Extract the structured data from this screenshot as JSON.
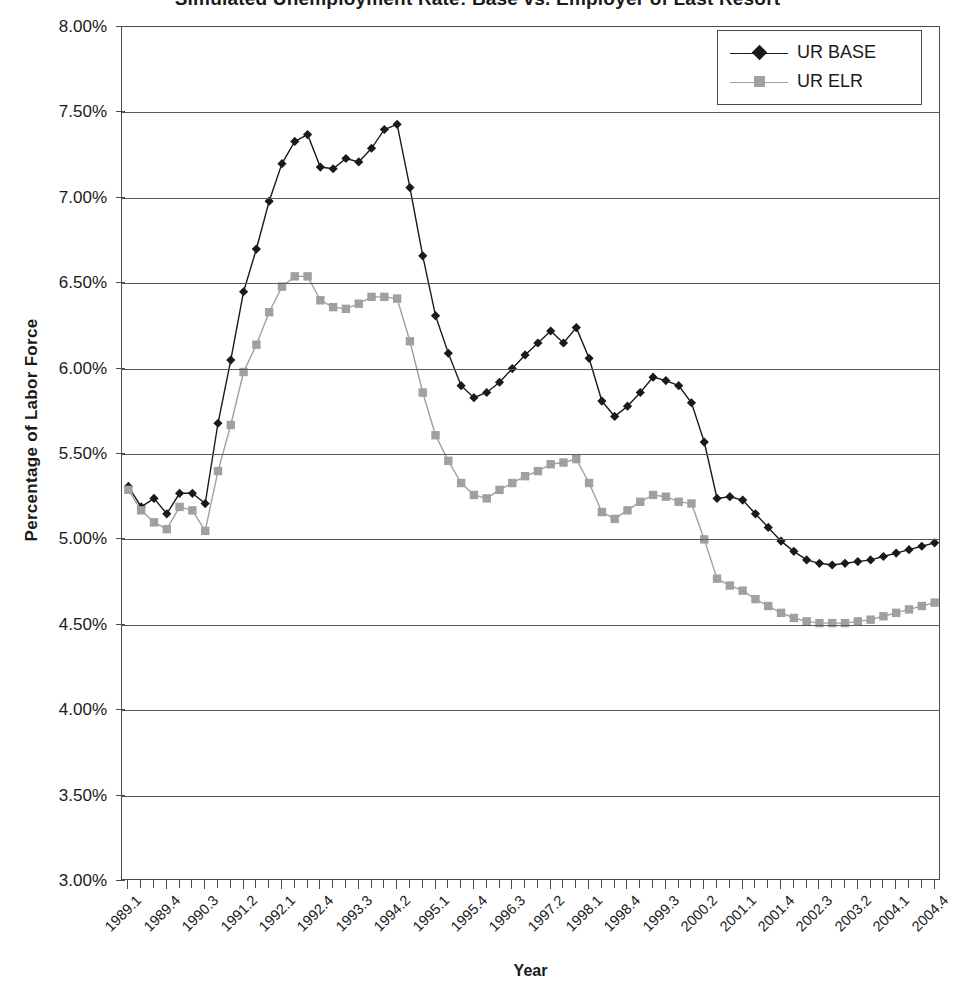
{
  "chart": {
    "title": "Simulated Unemployment Rate: Base vs. Employer of Last Resort",
    "xlabel": "Year",
    "ylabel": "Percentage of Labor Force"
  },
  "legend": {
    "position": "top-right",
    "items": [
      {
        "label": "UR BASE",
        "color": "#1a1a1a",
        "marker": "diamond"
      },
      {
        "label": "UR ELR",
        "color": "#a0a0a0",
        "marker": "square"
      }
    ]
  },
  "axes": {
    "y_ticks": [
      "3.00%",
      "3.50%",
      "4.00%",
      "4.50%",
      "5.00%",
      "5.50%",
      "6.00%",
      "6.50%",
      "7.00%",
      "7.50%",
      "8.00%"
    ],
    "y_values": [
      3.0,
      3.5,
      4.0,
      4.5,
      5.0,
      5.5,
      6.0,
      6.5,
      7.0,
      7.5,
      8.0
    ],
    "y_min": 3.0,
    "y_max": 8.0,
    "x_tick_labels": [
      "1989.1",
      "1989.4",
      "1990.3",
      "1991.2",
      "1992.1",
      "1992.4",
      "1993.3",
      "1994.2",
      "1995.1",
      "1995.4",
      "1996.3",
      "1997.2",
      "1998.1",
      "1998.4",
      "1999.3",
      "2000.2",
      "2001.1",
      "2001.4",
      "2002.3",
      "2003.2",
      "2004.1",
      "2004.4"
    ],
    "x_tick_label_every": 3,
    "grid": "horizontal"
  },
  "chart_data": {
    "type": "line",
    "title": "Simulated Unemployment Rate: Base vs. Employer of Last Resort",
    "xlabel": "Year",
    "ylabel": "Percentage of Labor Force",
    "ylim": [
      3.0,
      8.0
    ],
    "grid": true,
    "legend_position": "top-right",
    "x": [
      "1989.1",
      "1989.2",
      "1989.3",
      "1989.4",
      "1990.1",
      "1990.2",
      "1990.3",
      "1990.4",
      "1991.1",
      "1991.2",
      "1991.3",
      "1991.4",
      "1992.1",
      "1992.2",
      "1992.3",
      "1992.4",
      "1993.1",
      "1993.2",
      "1993.3",
      "1993.4",
      "1994.1",
      "1994.2",
      "1994.3",
      "1994.4",
      "1995.1",
      "1995.2",
      "1995.3",
      "1995.4",
      "1996.1",
      "1996.2",
      "1996.3",
      "1996.4",
      "1997.1",
      "1997.2",
      "1997.3",
      "1997.4",
      "1998.1",
      "1998.2",
      "1998.3",
      "1998.4",
      "1999.1",
      "1999.2",
      "1999.3",
      "1999.4",
      "2000.1",
      "2000.2",
      "2000.3",
      "2000.4",
      "2001.1",
      "2001.2",
      "2001.3",
      "2001.4",
      "2002.1",
      "2002.2",
      "2002.3",
      "2002.4",
      "2003.1",
      "2003.2",
      "2003.3",
      "2003.4",
      "2004.1",
      "2004.2",
      "2004.3",
      "2004.4"
    ],
    "series": [
      {
        "name": "UR BASE",
        "color": "#1a1a1a",
        "marker": "diamond",
        "values": [
          5.31,
          5.19,
          5.24,
          5.15,
          5.27,
          5.27,
          5.21,
          5.68,
          6.05,
          6.45,
          6.7,
          6.98,
          7.2,
          7.33,
          7.37,
          7.18,
          7.17,
          7.23,
          7.21,
          7.29,
          7.4,
          7.43,
          7.06,
          6.66,
          6.31,
          6.09,
          5.9,
          5.83,
          5.86,
          5.92,
          6.0,
          6.08,
          6.15,
          6.22,
          6.15,
          6.24,
          6.06,
          5.81,
          5.72,
          5.78,
          5.86,
          5.95,
          5.93,
          5.9,
          5.8,
          5.57,
          5.24,
          5.25,
          5.23,
          5.15,
          5.07,
          4.99,
          4.93,
          4.88,
          4.86,
          4.85,
          4.86,
          4.87,
          4.88,
          4.9,
          4.92,
          4.94,
          4.96,
          4.98
        ]
      },
      {
        "name": "UR ELR",
        "color": "#a0a0a0",
        "marker": "square",
        "values": [
          5.29,
          5.17,
          5.1,
          5.06,
          5.19,
          5.17,
          5.05,
          5.4,
          5.67,
          5.98,
          6.14,
          6.33,
          6.48,
          6.54,
          6.54,
          6.4,
          6.36,
          6.35,
          6.38,
          6.42,
          6.42,
          6.41,
          6.16,
          5.86,
          5.61,
          5.46,
          5.33,
          5.26,
          5.24,
          5.29,
          5.33,
          5.37,
          5.4,
          5.44,
          5.45,
          5.47,
          5.33,
          5.16,
          5.12,
          5.17,
          5.22,
          5.26,
          5.25,
          5.22,
          5.21,
          5.0,
          4.77,
          4.73,
          4.7,
          4.65,
          4.61,
          4.57,
          4.54,
          4.52,
          4.51,
          4.51,
          4.51,
          4.52,
          4.53,
          4.55,
          4.57,
          4.59,
          4.61,
          4.63
        ]
      }
    ]
  }
}
